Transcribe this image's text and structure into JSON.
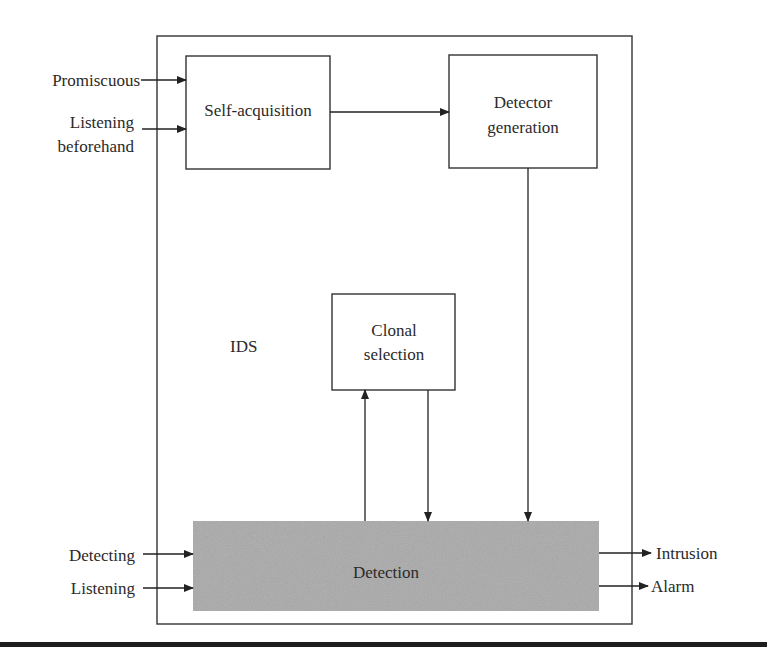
{
  "diagram": {
    "container": {
      "label": "IDS"
    },
    "boxes": {
      "self_acquisition": {
        "label": "Self-acquisition"
      },
      "detector_generation": {
        "line1": "Detector",
        "line2": "generation"
      },
      "clonal_selection": {
        "line1": "Clonal",
        "line2": "selection"
      },
      "detection": {
        "label": "Detection",
        "fill": "#a9a9a9"
      }
    },
    "inputs": {
      "promiscuous": "Promiscuous",
      "listening_beforehand_line1": "Listening",
      "listening_beforehand_line2": "beforehand",
      "detecting": "Detecting",
      "listening": "Listening"
    },
    "outputs": {
      "intrusion": "Intrusion",
      "alarm": "Alarm"
    },
    "edges": [
      {
        "from": "Promiscuous",
        "to": "Self-acquisition"
      },
      {
        "from": "Listening beforehand",
        "to": "Self-acquisition"
      },
      {
        "from": "Self-acquisition",
        "to": "Detector generation"
      },
      {
        "from": "Detector generation",
        "to": "Detection"
      },
      {
        "from": "Detection",
        "to": "Clonal selection"
      },
      {
        "from": "Clonal selection",
        "to": "Detection"
      },
      {
        "from": "Detecting",
        "to": "Detection"
      },
      {
        "from": "Listening",
        "to": "Detection"
      },
      {
        "from": "Detection",
        "to": "Intrusion"
      },
      {
        "from": "Detection",
        "to": "Alarm"
      }
    ]
  }
}
